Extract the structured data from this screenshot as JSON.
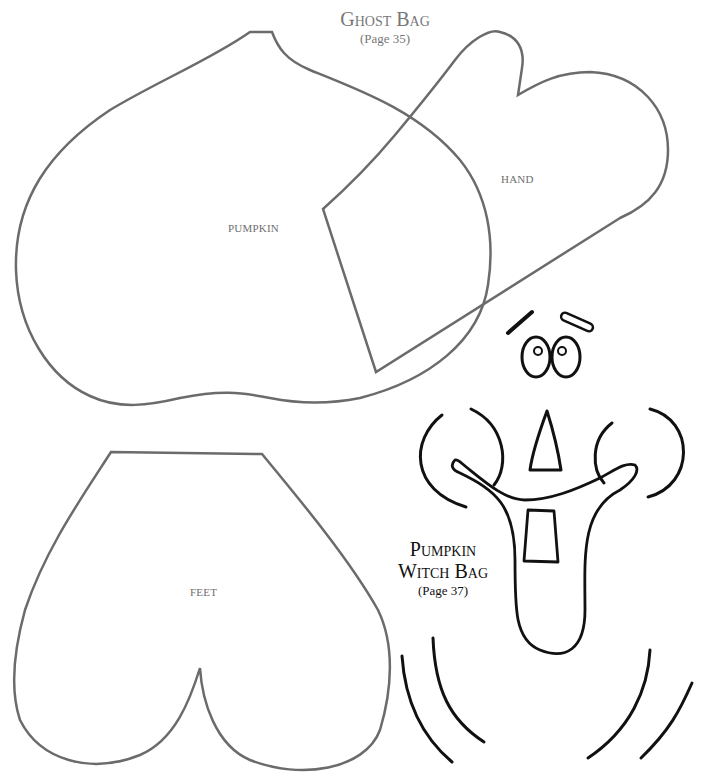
{
  "document": {
    "sections": [
      {
        "id": "ghost-bag",
        "title": "Ghost Bag",
        "page_ref": "(Page 35)",
        "pattern_pieces": [
          {
            "name": "pumpkin",
            "label": "PUMPKIN"
          },
          {
            "name": "hand",
            "label": "HAND"
          },
          {
            "name": "feet",
            "label": "FEET"
          }
        ]
      },
      {
        "id": "pumpkin-witch-bag",
        "title_line1": "Pumpkin",
        "title_line2": "Witch Bag",
        "page_ref": "(Page 37)",
        "pattern_pieces": [
          {
            "name": "face",
            "parts": [
              "eyebrows",
              "eyes",
              "nose",
              "cheeks",
              "mouth",
              "tooth",
              "chin-lines"
            ]
          }
        ]
      }
    ]
  },
  "colors": {
    "ghost_outline": "#6b6b6b",
    "witch_outline": "#111111",
    "label_text": "#6e6e6e",
    "background": "#ffffff"
  }
}
